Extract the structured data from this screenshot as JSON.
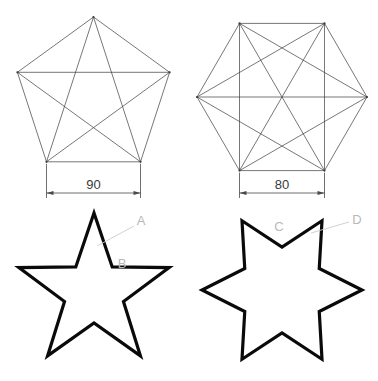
{
  "canvas": {
    "width": 378,
    "height": 381,
    "background": "#ffffff"
  },
  "style": {
    "construction_stroke": "#3c3c3c",
    "construction_width": 0.7,
    "dimension_stroke": "#4a4a4a",
    "dimension_width": 0.8,
    "outline_stroke": "#0a0a0a",
    "outline_width": 3.2,
    "leader_stroke": "#cccccc",
    "leader_width": 0.9,
    "dim_text_color": "#3a3a3a",
    "callout_text_color": "#b9b9b9"
  },
  "figures": {
    "pentagon": {
      "name": "pentagon-with-pentagram",
      "sides": 5,
      "center": {
        "x": 93.5,
        "y": 97
      },
      "circumradius": 80,
      "rotation_deg": -90,
      "vertices": [
        {
          "x": 93.5,
          "y": 17.0
        },
        {
          "x": 169.6,
          "y": 72.3
        },
        {
          "x": 140.5,
          "y": 161.8
        },
        {
          "x": 46.5,
          "y": 161.8
        },
        {
          "x": 17.4,
          "y": 72.3
        }
      ],
      "diagonals": [
        [
          0,
          2
        ],
        [
          0,
          3
        ],
        [
          1,
          3
        ],
        [
          1,
          4
        ],
        [
          2,
          4
        ]
      ],
      "dimension": {
        "label": "90",
        "units": "",
        "measures": "bottom-edge-width",
        "line_y": 193,
        "x_start": 46.5,
        "x_end": 140.5,
        "extension_from_y": 161.8
      }
    },
    "hexagon": {
      "name": "hexagon-with-star-diagonals",
      "sides": 6,
      "center": {
        "x": 282,
        "y": 97
      },
      "circumradius": 85,
      "orientation": "flat-top-pointy-left-right",
      "vertices": [
        {
          "x": 367.0,
          "y": 97.0
        },
        {
          "x": 324.5,
          "y": 23.4
        },
        {
          "x": 239.5,
          "y": 23.4
        },
        {
          "x": 197.0,
          "y": 97.0
        },
        {
          "x": 239.5,
          "y": 170.6
        },
        {
          "x": 324.5,
          "y": 170.6
        }
      ],
      "diagonals": [
        [
          0,
          2
        ],
        [
          0,
          3
        ],
        [
          0,
          4
        ],
        [
          1,
          3
        ],
        [
          1,
          4
        ],
        [
          1,
          5
        ],
        [
          2,
          4
        ],
        [
          2,
          5
        ],
        [
          3,
          5
        ]
      ],
      "dimension": {
        "label": "80",
        "units": "",
        "measures": "bottom-edge-width",
        "line_y": 193,
        "x_start": 239.5,
        "x_end": 324.5,
        "extension_from_y": 170.6
      }
    },
    "star5": {
      "name": "five-pointed-star-outline",
      "points": 5,
      "center": {
        "x": 94,
        "y": 292
      },
      "outer_radius": 79,
      "inner_radius": 31,
      "rotation_deg": -90,
      "callouts": [
        {
          "label": "A",
          "name": "callout-a",
          "text_x": 141,
          "text_y": 225,
          "leader": [
            {
              "x": 97,
              "y": 246
            },
            {
              "x": 134,
              "y": 226
            }
          ]
        },
        {
          "label": "B",
          "name": "callout-b",
          "text_x": 122,
          "text_y": 268,
          "leader": []
        }
      ]
    },
    "star6": {
      "name": "six-pointed-star-outline",
      "points": 6,
      "center": {
        "x": 282,
        "y": 290
      },
      "outer_radius": 80,
      "inner_radius": 43,
      "rotation_deg": -60,
      "callouts": [
        {
          "label": "C",
          "name": "callout-c",
          "text_x": 279,
          "text_y": 231,
          "leader": []
        },
        {
          "label": "D",
          "name": "callout-d",
          "text_x": 357,
          "text_y": 224,
          "leader": [
            {
              "x": 311,
              "y": 233
            },
            {
              "x": 349,
              "y": 222
            }
          ]
        }
      ]
    }
  }
}
